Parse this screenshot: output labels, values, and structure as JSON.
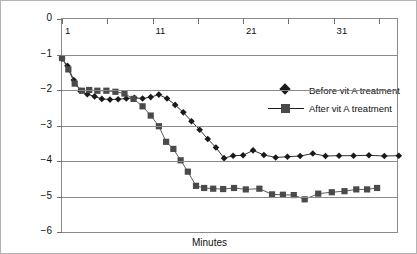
{
  "chart_data": {
    "type": "line",
    "title": "",
    "xlabel": "Minutes",
    "ylabel": "Luminance (log cd)",
    "xlim": [
      1,
      38
    ],
    "ylim": [
      -6,
      0
    ],
    "xticks": [
      1,
      6,
      11,
      16,
      21,
      26,
      31,
      36
    ],
    "xticklabels": [
      "1",
      "",
      "11",
      "",
      "21",
      "",
      "31",
      ""
    ],
    "yticks": [
      0,
      -1,
      -2,
      -3,
      -4,
      -5,
      -6
    ],
    "yticklabels": [
      "0",
      "−1",
      "−2",
      "−3",
      "−4",
      "−5",
      "−6"
    ],
    "grid": true,
    "legend_position": "center",
    "series": [
      {
        "name": "Before vit A treatment",
        "marker": "diamond",
        "color": "#1a1a1a",
        "x": [
          1.0,
          1.6,
          2.3,
          3.0,
          3.8,
          4.6,
          5.4,
          6.3,
          7.2,
          8.1,
          9.0,
          9.9,
          10.8,
          11.7,
          12.6,
          13.5,
          14.4,
          15.3,
          16.2,
          17.1,
          18.0,
          18.9,
          19.9,
          21.0,
          22.1,
          23.3,
          24.6,
          25.9,
          27.3,
          28.7,
          30.1,
          31.6,
          33.2,
          34.9,
          36.6,
          38.2
        ],
        "y": [
          -1.12,
          -1.32,
          -1.72,
          -2.02,
          -2.12,
          -2.18,
          -2.25,
          -2.27,
          -2.26,
          -2.24,
          -2.22,
          -2.24,
          -2.2,
          -2.13,
          -2.24,
          -2.42,
          -2.63,
          -2.88,
          -3.12,
          -3.38,
          -3.62,
          -3.92,
          -3.85,
          -3.84,
          -3.7,
          -3.83,
          -3.9,
          -3.88,
          -3.86,
          -3.79,
          -3.86,
          -3.85,
          -3.85,
          -3.84,
          -3.86,
          -3.85
        ]
      },
      {
        "name": "After vit A treatment",
        "marker": "square",
        "color": "#4a4a4a",
        "x": [
          1.0,
          1.7,
          2.4,
          3.2,
          4.0,
          4.9,
          5.9,
          6.9,
          7.9,
          8.9,
          9.9,
          10.8,
          11.7,
          12.5,
          13.3,
          14.1,
          14.9,
          15.8,
          16.7,
          17.7,
          18.8,
          20.0,
          21.3,
          22.8,
          24.2,
          25.4,
          26.6,
          27.8,
          29.3,
          30.8,
          32.2,
          33.5,
          34.7,
          35.8
        ],
        "y": [
          -1.1,
          -1.42,
          -1.82,
          -2.02,
          -2.0,
          -2.02,
          -2.02,
          -2.05,
          -2.1,
          -2.25,
          -2.46,
          -2.72,
          -3.02,
          -3.46,
          -3.66,
          -3.98,
          -4.3,
          -4.7,
          -4.76,
          -4.78,
          -4.79,
          -4.76,
          -4.8,
          -4.78,
          -4.94,
          -4.95,
          -4.96,
          -5.08,
          -4.92,
          -4.88,
          -4.85,
          -4.8,
          -4.8,
          -4.76
        ]
      }
    ]
  }
}
